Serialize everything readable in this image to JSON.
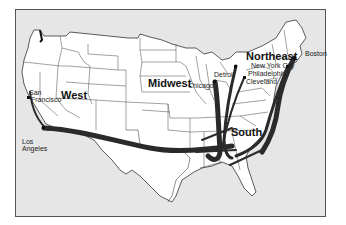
{
  "map": {
    "regions": [
      {
        "name": "West",
        "x": 61,
        "y": 90
      },
      {
        "name": "Midwest",
        "x": 148,
        "y": 78
      },
      {
        "name": "Northeast",
        "x": 246,
        "y": 51
      },
      {
        "name": "South",
        "x": 231,
        "y": 127
      }
    ],
    "cities": [
      {
        "name": "San\nFrancisco",
        "x": 20,
        "y": 89
      },
      {
        "name": "Los\nAngeles",
        "x": 18,
        "y": 128
      },
      {
        "name": "Chicago",
        "x": 188,
        "y": 81
      },
      {
        "name": "Detroit",
        "x": 214,
        "y": 71
      },
      {
        "name": "New York City",
        "x": 252,
        "y": 63
      },
      {
        "name": "Philadelphia",
        "x": 248,
        "y": 71
      },
      {
        "name": "Cleveland",
        "x": 247,
        "y": 79
      },
      {
        "name": "Boston",
        "x": 304,
        "y": 53
      }
    ],
    "colors": {
      "background": "#e6e6e6",
      "land": "#ffffff",
      "border": "#333333",
      "flow": "#2a2a2a"
    }
  }
}
